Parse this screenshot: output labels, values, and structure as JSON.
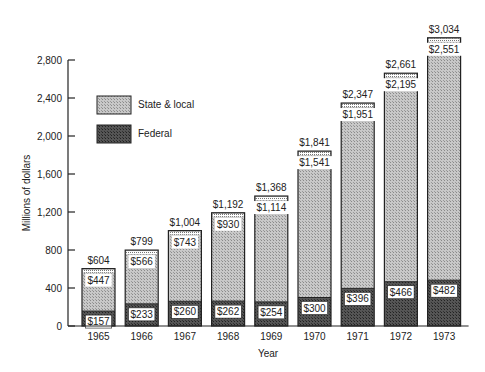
{
  "chart_data": {
    "type": "bar",
    "stacked": true,
    "title": "",
    "xlabel": "Year",
    "ylabel": "Millions of dollars",
    "ylim": [
      0,
      2800
    ],
    "yticks": [
      0,
      400,
      800,
      1200,
      1600,
      2000,
      2400,
      2800
    ],
    "ytick_labels": [
      "0",
      "400",
      "800",
      "1,200",
      "1,600",
      "2,000",
      "2,400",
      "2,800"
    ],
    "grid": false,
    "legend_position": "upper-left inside",
    "categories": [
      "1965",
      "1966",
      "1967",
      "1968",
      "1969",
      "1970",
      "1971",
      "1972",
      "1973"
    ],
    "series": [
      {
        "name": "Federal",
        "values": [
          157,
          233,
          260,
          262,
          254,
          300,
          396,
          466,
          482
        ],
        "labels": [
          "$157",
          "$233",
          "$260",
          "$262",
          "$254",
          "$300",
          "$396",
          "$466",
          "$482"
        ],
        "color": "#4a4a4a"
      },
      {
        "name": "State & local",
        "values": [
          447,
          566,
          743,
          930,
          1114,
          1541,
          1951,
          2195,
          2551
        ],
        "labels": [
          "$447",
          "$566",
          "$743",
          "$930",
          "$1,114",
          "$1,541",
          "$1,951",
          "$2,195",
          "$2,551"
        ],
        "color": "#b5b5b5"
      }
    ],
    "totals": [
      604,
      799,
      1004,
      1192,
      1368,
      1841,
      2347,
      2661,
      3034
    ],
    "total_labels": [
      "$604",
      "$799",
      "$1,004",
      "$1,192",
      "$1,368",
      "$1,841",
      "$2,347",
      "$2,661",
      "$3,034"
    ]
  },
  "legend": {
    "items": [
      {
        "label": "State & local",
        "color": "#b5b5b5"
      },
      {
        "label": "Federal",
        "color": "#4a4a4a"
      }
    ]
  }
}
